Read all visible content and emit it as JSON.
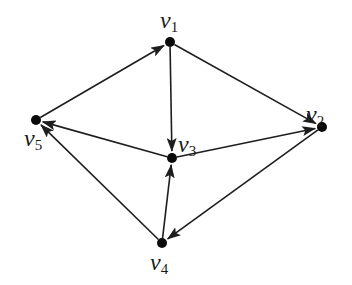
{
  "diagram": {
    "type": "directed-graph",
    "colors": {
      "stroke": "#1e1e1e",
      "node": "#0a0a0a",
      "background": "#ffffff"
    },
    "nodes": [
      {
        "id": "v1",
        "base": "v",
        "sub": "1",
        "x": 170,
        "y": 42,
        "label_x": 160,
        "label_y": 8
      },
      {
        "id": "v2",
        "base": "v",
        "sub": "2",
        "x": 322,
        "y": 127,
        "label_x": 306,
        "label_y": 102
      },
      {
        "id": "v3",
        "base": "v",
        "sub": "3",
        "x": 172,
        "y": 158,
        "label_x": 178,
        "label_y": 132
      },
      {
        "id": "v4",
        "base": "v",
        "sub": "4",
        "x": 162,
        "y": 243,
        "label_x": 150,
        "label_y": 250
      },
      {
        "id": "v5",
        "base": "v",
        "sub": "5",
        "x": 36,
        "y": 120,
        "label_x": 24,
        "label_y": 126
      }
    ],
    "edges": [
      {
        "from": "v5",
        "to": "v1"
      },
      {
        "from": "v1",
        "to": "v3"
      },
      {
        "from": "v1",
        "to": "v2"
      },
      {
        "from": "v3",
        "to": "v5"
      },
      {
        "from": "v3",
        "to": "v2"
      },
      {
        "from": "v4",
        "to": "v3"
      },
      {
        "from": "v4",
        "to": "v5"
      },
      {
        "from": "v2",
        "to": "v4"
      }
    ]
  }
}
